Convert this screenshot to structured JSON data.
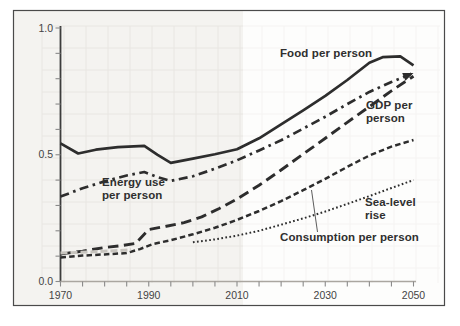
{
  "figure": {
    "background_color": "#ffffff",
    "border_color": "#4a4a4a",
    "line_color": "#2d2d2d",
    "grid_color": "#e8e6e2",
    "tick_label_color": "#444444"
  },
  "chart_data": {
    "type": "line",
    "title": "",
    "xlabel": "",
    "ylabel": "",
    "x_axis": {
      "range": [
        1970,
        2050
      ],
      "tick_interval_years": 5,
      "labeled_ticks": [
        "1970",
        "1990",
        "2010",
        "2030",
        "2050"
      ]
    },
    "y_axis": {
      "range": [
        0,
        1.0
      ],
      "tick_interval": 0.1,
      "labeled_ticks": [
        "1.0",
        "0.5",
        "0.0"
      ]
    },
    "grid": true,
    "legend": "inline-annotations",
    "series": [
      {
        "name": "Food per person",
        "style": "solid",
        "points": [
          [
            1970,
            0.545
          ],
          [
            1974,
            0.505
          ],
          [
            1978,
            0.52
          ],
          [
            1983,
            0.53
          ],
          [
            1989,
            0.535
          ],
          [
            1992,
            0.5
          ],
          [
            1995,
            0.468
          ],
          [
            2000,
            0.485
          ],
          [
            2005,
            0.502
          ],
          [
            2010,
            0.522
          ],
          [
            2015,
            0.565
          ],
          [
            2020,
            0.62
          ],
          [
            2025,
            0.675
          ],
          [
            2030,
            0.732
          ],
          [
            2035,
            0.795
          ],
          [
            2040,
            0.863
          ],
          [
            2043,
            0.885
          ],
          [
            2047,
            0.888
          ],
          [
            2050,
            0.853
          ]
        ]
      },
      {
        "name": "Energy use per person",
        "style": "dash-dot",
        "arrow_end": true,
        "points": [
          [
            1970,
            0.335
          ],
          [
            1975,
            0.368
          ],
          [
            1980,
            0.395
          ],
          [
            1985,
            0.418
          ],
          [
            1989,
            0.432
          ],
          [
            1992,
            0.412
          ],
          [
            1995,
            0.397
          ],
          [
            2000,
            0.415
          ],
          [
            2005,
            0.445
          ],
          [
            2010,
            0.478
          ],
          [
            2015,
            0.517
          ],
          [
            2020,
            0.557
          ],
          [
            2025,
            0.603
          ],
          [
            2030,
            0.65
          ],
          [
            2035,
            0.7
          ],
          [
            2040,
            0.748
          ],
          [
            2045,
            0.787
          ],
          [
            2050,
            0.823
          ]
        ]
      },
      {
        "name": "GDP per person",
        "style": "long-dash",
        "points": [
          [
            1970,
            0.108
          ],
          [
            1975,
            0.12
          ],
          [
            1980,
            0.134
          ],
          [
            1984,
            0.142
          ],
          [
            1987,
            0.15
          ],
          [
            1990,
            0.205
          ],
          [
            1994,
            0.218
          ],
          [
            1998,
            0.232
          ],
          [
            2002,
            0.255
          ],
          [
            2006,
            0.288
          ],
          [
            2010,
            0.325
          ],
          [
            2015,
            0.38
          ],
          [
            2020,
            0.44
          ],
          [
            2025,
            0.503
          ],
          [
            2030,
            0.565
          ],
          [
            2035,
            0.628
          ],
          [
            2040,
            0.69
          ],
          [
            2045,
            0.752
          ],
          [
            2050,
            0.81
          ]
        ]
      },
      {
        "name": "Consumption per person",
        "style": "short-dash",
        "points": [
          [
            1970,
            0.095
          ],
          [
            1975,
            0.102
          ],
          [
            1980,
            0.107
          ],
          [
            1985,
            0.112
          ],
          [
            1988,
            0.128
          ],
          [
            1991,
            0.148
          ],
          [
            1995,
            0.163
          ],
          [
            2000,
            0.186
          ],
          [
            2005,
            0.212
          ],
          [
            2010,
            0.243
          ],
          [
            2015,
            0.278
          ],
          [
            2020,
            0.317
          ],
          [
            2025,
            0.36
          ],
          [
            2030,
            0.405
          ],
          [
            2035,
            0.452
          ],
          [
            2040,
            0.497
          ],
          [
            2045,
            0.532
          ],
          [
            2050,
            0.558
          ]
        ]
      },
      {
        "name": "Sea-level rise",
        "style": "dotted",
        "points": [
          [
            2000,
            0.155
          ],
          [
            2005,
            0.166
          ],
          [
            2010,
            0.181
          ],
          [
            2015,
            0.2
          ],
          [
            2020,
            0.224
          ],
          [
            2025,
            0.249
          ],
          [
            2030,
            0.276
          ],
          [
            2035,
            0.306
          ],
          [
            2040,
            0.337
          ],
          [
            2045,
            0.369
          ],
          [
            2050,
            0.4
          ]
        ]
      },
      {
        "name": "faint historical overlap segment",
        "style": "faint",
        "points": [
          [
            1970,
            0.112
          ],
          [
            1976,
            0.116
          ],
          [
            1982,
            0.121
          ],
          [
            1986,
            0.125
          ]
        ]
      }
    ]
  }
}
